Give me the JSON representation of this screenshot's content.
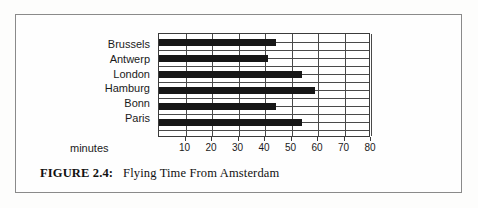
{
  "figure": {
    "caption_label": "FIGURE 2.4:",
    "caption_text": "Flying Time From Amsterdam",
    "frame_color": "#8a8a8a",
    "background": "#fefefe"
  },
  "chart_data": {
    "type": "bar",
    "orientation": "horizontal",
    "title": "Flying Time From Amsterdam",
    "xlabel": "minutes",
    "ylabel": "",
    "categories": [
      "Brussels",
      "Antwerp",
      "London",
      "Hamburg",
      "Bonn",
      "Paris"
    ],
    "values": [
      44,
      41,
      54,
      59,
      44,
      54
    ],
    "xlim": [
      0,
      80
    ],
    "xticks": [
      10,
      20,
      30,
      40,
      50,
      60,
      70,
      80
    ],
    "xtick_labels": [
      "10",
      "20",
      "30",
      "40",
      "50",
      "60",
      "70",
      "80"
    ],
    "grid": true,
    "grid_axis": "both",
    "legend": false,
    "bar_color": "#171717",
    "grid_color": "#4a4a4a",
    "plot_background": "#ffffff"
  }
}
